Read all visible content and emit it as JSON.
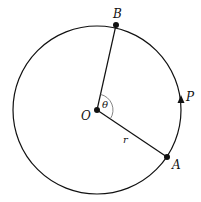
{
  "diagram": {
    "type": "circle-geometry",
    "labels": {
      "center": "O",
      "point_a": "A",
      "point_b": "B",
      "moving_point": "P",
      "angle": "θ",
      "radius": "r"
    },
    "colors": {
      "stroke": "#111111",
      "background": "#ffffff"
    }
  }
}
